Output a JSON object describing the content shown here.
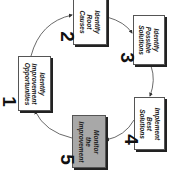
{
  "diagram": {
    "type": "cycle",
    "orientation": "rotated-90-clockwise",
    "steps": [
      {
        "number": "1",
        "label": "Identify\nImprovement\nOpportunities",
        "highlighted": false
      },
      {
        "number": "2",
        "label": "Identify\nRoot\nCauses",
        "highlighted": false
      },
      {
        "number": "3",
        "label": "Identify\nPossible\nSolutions",
        "highlighted": false
      },
      {
        "number": "4",
        "label": "Implement\nBest\nSolutions",
        "highlighted": false
      },
      {
        "number": "5",
        "label": "Monitor\nthe\nImprovement",
        "highlighted": true
      }
    ],
    "flow": [
      "1->2",
      "2->3",
      "3->4",
      "4->5",
      "5->1"
    ],
    "colors": {
      "highlight": "#a8a8a8",
      "box": "#ffffff",
      "line": "#333333"
    }
  }
}
